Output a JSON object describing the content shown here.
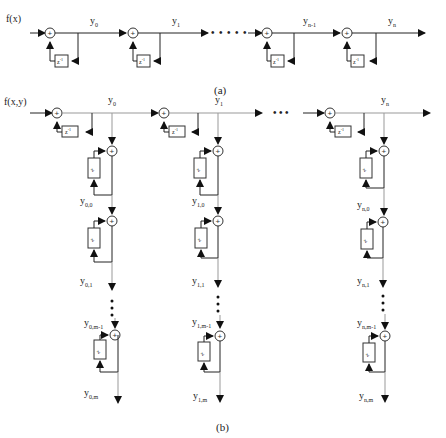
{
  "diagram": {
    "part_a": {
      "caption": "(a)",
      "input_label": "f(x)",
      "delay_label": "z",
      "delay_exp": "-1",
      "sum_symbol": "+",
      "stages": [
        {
          "output": "y",
          "sub": "0"
        },
        {
          "output": "y",
          "sub": "1"
        },
        {
          "output": "y",
          "sub": "n-1"
        },
        {
          "output": "y",
          "sub": "n"
        }
      ],
      "ellipsis": "• • • • •"
    },
    "part_b": {
      "caption": "(b)",
      "input_label": "f(x,y)",
      "delay_label": "z",
      "delay_exp": "-1",
      "sum_symbol": "+",
      "inner_delay_label": "z",
      "inner_delay_exp": "-1",
      "top_outputs": [
        {
          "output": "y",
          "sub": "0"
        },
        {
          "output": "y",
          "sub": "1"
        },
        {
          "output": "y",
          "sub": "n"
        }
      ],
      "ellipsis": "• • •",
      "columns": [
        {
          "labels": [
            {
              "y": "y",
              "sub": "0,0"
            },
            {
              "y": "y",
              "sub": "0,1"
            },
            {
              "y": "y",
              "sub": "0,m-1"
            },
            {
              "y": "y",
              "sub": "0,m"
            }
          ]
        },
        {
          "labels": [
            {
              "y": "y",
              "sub": "1,0"
            },
            {
              "y": "y",
              "sub": "1,1"
            },
            {
              "y": "y",
              "sub": "1,m-1"
            },
            {
              "y": "y",
              "sub": "1,m"
            }
          ]
        },
        {
          "labels": [
            {
              "y": "y",
              "sub": "n,0"
            },
            {
              "y": "y",
              "sub": "n,1"
            },
            {
              "y": "y",
              "sub": "n,m-1"
            },
            {
              "y": "y",
              "sub": "n,m"
            }
          ]
        }
      ]
    }
  }
}
